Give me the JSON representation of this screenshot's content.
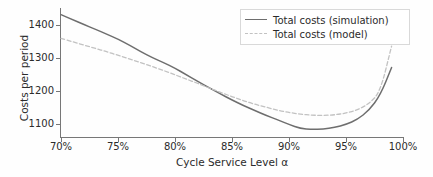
{
  "chart_data": {
    "type": "line",
    "title": "",
    "xlabel": "Cycle Service Level α",
    "ylabel": "Costs per period",
    "xlim": [
      70,
      100
    ],
    "ylim": [
      1060,
      1450
    ],
    "grid": false,
    "legend_position": "top-right",
    "xticks": [
      "70%",
      "75%",
      "80%",
      "85%",
      "90%",
      "95%",
      "100%"
    ],
    "xtick_values": [
      70,
      75,
      80,
      85,
      90,
      95,
      100
    ],
    "yticks": [
      "1100",
      "1200",
      "1300",
      "1400"
    ],
    "ytick_values": [
      1100,
      1200,
      1300,
      1400
    ],
    "x": [
      70,
      71,
      72,
      73,
      74,
      75,
      76,
      77,
      78,
      79,
      80,
      81,
      82,
      83,
      84,
      85,
      86,
      87,
      88,
      89,
      90,
      91,
      92,
      93,
      94,
      95,
      96,
      97,
      98,
      99
    ],
    "series": [
      {
        "name": "Total costs (simulation)",
        "style": "solid",
        "color": "#6e6e6e",
        "values": [
          1430,
          1415,
          1400,
          1386,
          1371,
          1356,
          1338,
          1318,
          1300,
          1285,
          1268,
          1248,
          1228,
          1209,
          1190,
          1172,
          1155,
          1140,
          1125,
          1112,
          1098,
          1086,
          1083,
          1084,
          1089,
          1098,
          1113,
          1140,
          1186,
          1270
        ]
      },
      {
        "name": "Total costs (model)",
        "style": "dashed",
        "color": "#c2c2c2",
        "values": [
          1358,
          1348,
          1338,
          1328,
          1318,
          1307,
          1296,
          1285,
          1273,
          1261,
          1248,
          1235,
          1222,
          1208,
          1195,
          1182,
          1170,
          1159,
          1150,
          1141,
          1134,
          1129,
          1126,
          1125,
          1127,
          1132,
          1142,
          1160,
          1196,
          1335
        ]
      }
    ]
  },
  "legend": {
    "items": [
      {
        "label": "Total costs (simulation)"
      },
      {
        "label": "Total costs (model)"
      }
    ]
  }
}
